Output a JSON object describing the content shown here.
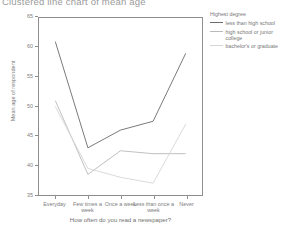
{
  "chart_title": "Clustered line chart of mean age",
  "axes": {
    "y_title": "Mean age of respondent",
    "x_title": "How often do you read a newspaper?",
    "y_ticks": [
      "65",
      "60",
      "55",
      "50",
      "45",
      "40",
      "35"
    ],
    "y_min": 35,
    "y_max": 65
  },
  "legend": {
    "title": "Highest degree",
    "items": [
      {
        "label": "less than high school",
        "color": "#6b6b6b"
      },
      {
        "label": "high school or junior college",
        "color": "#b9b9b9"
      },
      {
        "label": "bachelor's or graduate",
        "color": "#d6d6d6"
      }
    ]
  },
  "chart_data": {
    "type": "line",
    "title": "Clustered line chart of mean age",
    "xlabel": "How often do you read a newspaper?",
    "ylabel": "Mean age of respondent",
    "ylim": [
      35,
      65
    ],
    "grid": false,
    "legend_position": "right",
    "legend_title": "Highest degree",
    "categories": [
      "Everyday",
      "Few times a week",
      "Once a week",
      "Less than once a week",
      "Never"
    ],
    "series": [
      {
        "name": "less than high school",
        "color": "#6b6b6b",
        "values": [
          61.0,
          43.0,
          46.0,
          47.5,
          59.0
        ]
      },
      {
        "name": "high school or junior college",
        "color": "#b9b9b9",
        "values": [
          51.0,
          38.5,
          42.5,
          42.0,
          42.0
        ]
      },
      {
        "name": "bachelor's or graduate",
        "color": "#d6d6d6",
        "values": [
          50.0,
          39.5,
          38.0,
          37.0,
          47.0
        ]
      }
    ]
  }
}
